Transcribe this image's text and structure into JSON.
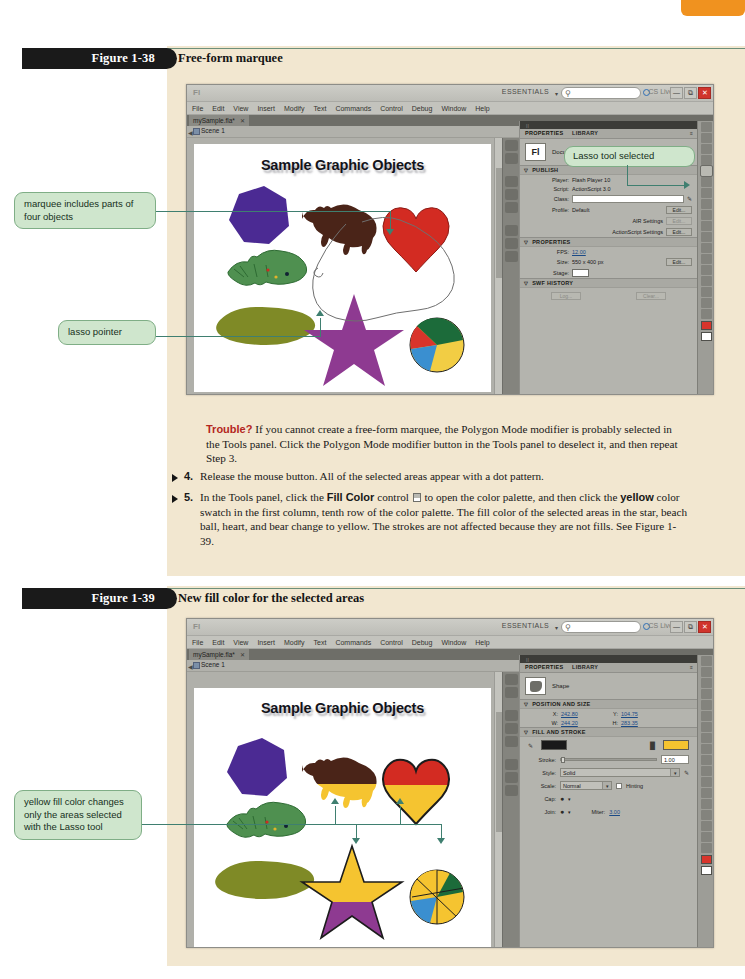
{
  "page": {
    "tab_color": "#f0921f",
    "content_bg": "#f2e7d0"
  },
  "figures": [
    {
      "number": "Figure 1-38",
      "caption": "Free-form marquee"
    },
    {
      "number": "Figure 1-39",
      "caption": "New fill color for the selected areas"
    }
  ],
  "flash_window": {
    "app_logo": "Fl",
    "workspace": "ESSENTIALS",
    "workspace_caret": "▾",
    "search_icon": "search-icon",
    "search_value": "",
    "cs_live": "CS Live",
    "cs_live_caret": "▾",
    "win_buttons": [
      "—",
      "⧉",
      "✕"
    ],
    "menus": [
      "File",
      "Edit",
      "View",
      "Insert",
      "Modify",
      "Text",
      "Commands",
      "Control",
      "Debug",
      "Window",
      "Help"
    ],
    "document_tab": "mySample.fla*",
    "document_tab_close": "✕",
    "scene": "Scene 1",
    "scene_back_arrow": "⬅",
    "zoom_level": "116%",
    "zoom_caret": "▾",
    "stage_title": "Sample Graphic Objects"
  },
  "properties_panel_doc": {
    "tabs": [
      "PROPERTIES",
      "LIBRARY"
    ],
    "menu_icon": "≡",
    "thumb_label": "Fl",
    "type": "Document",
    "sections": [
      {
        "title": "PUBLISH",
        "rows": [
          {
            "key": "Player:",
            "value": "Flash Player 10",
            "kind": "text"
          },
          {
            "key": "Script:",
            "value": "ActionScript 3.0",
            "kind": "text"
          },
          {
            "key": "Class:",
            "value": "",
            "kind": "field-pencil"
          },
          {
            "key": "Profile:",
            "value": "Default",
            "button": "Edit...",
            "kind": "text-button"
          },
          {
            "key": "",
            "value": "AIR Settings",
            "button": "Edit...",
            "kind": "right-button-dim"
          },
          {
            "key": "",
            "value": "ActionScript Settings",
            "button": "Edit...",
            "kind": "right-button"
          }
        ]
      },
      {
        "title": "PROPERTIES",
        "rows": [
          {
            "key": "FPS:",
            "value": "12.00",
            "kind": "link"
          },
          {
            "key": "Size:",
            "value": "550 x 400 px",
            "button": "Edit...",
            "kind": "text-button"
          },
          {
            "key": "Stage:",
            "value": "",
            "kind": "swatch"
          }
        ]
      },
      {
        "title": "SWF HISTORY",
        "rows": [
          {
            "key": "",
            "value": "",
            "button": "Log...",
            "button2": "Clear...",
            "kind": "two-buttons"
          }
        ]
      }
    ]
  },
  "properties_panel_shape": {
    "tabs": [
      "PROPERTIES",
      "LIBRARY"
    ],
    "menu_icon": "≡",
    "type": "Shape",
    "sections": [
      {
        "title": "POSITION AND SIZE",
        "rows": [
          {
            "key": "X:",
            "value": "242.80",
            "key2": "Y:",
            "value2": "104.75"
          },
          {
            "key": "W:",
            "value": "244.20",
            "key2": "H:",
            "value2": "283.35"
          }
        ]
      },
      {
        "title": "FILL AND STROKE",
        "rows": [
          {
            "stroke_color": "#1a1a1a",
            "fill_color": "#f5c430"
          },
          {
            "key": "Stroke:",
            "value": "1.00"
          },
          {
            "key": "Style:",
            "value": "Solid"
          },
          {
            "key": "Scale:",
            "value": "Normal",
            "checkbox_label": "Hinting"
          },
          {
            "key": "Cap:",
            "value": ""
          },
          {
            "key": "Join:",
            "value": "",
            "key2": "Miter:",
            "value2": "3.00"
          }
        ]
      }
    ]
  },
  "callouts": [
    {
      "id": "marquee-objects",
      "text": "marquee includes parts of four objects"
    },
    {
      "id": "lasso-pointer",
      "text": "lasso pointer"
    },
    {
      "id": "lasso-tool-selected",
      "text": "Lasso tool selected"
    },
    {
      "id": "yellow-fill",
      "text": "yellow fill color changes only the areas selected with the Lasso tool"
    }
  ],
  "body": {
    "trouble_label": "Trouble?",
    "trouble_text": "If you cannot create a free-form marquee, the Polygon Mode modifier is probably selected in the Tools panel. Click the Polygon Mode modifier button in the Tools panel to deselect it, and then repeat Step 3.",
    "steps": [
      {
        "num": "4.",
        "parts": [
          {
            "t": "Release the mouse button. All of the selected areas appear with a dot pattern.",
            "b": false
          }
        ]
      },
      {
        "num": "5.",
        "parts": [
          {
            "t": "In the Tools panel, click the ",
            "b": false
          },
          {
            "t": "Fill Color",
            "b": true
          },
          {
            "t": " control ",
            "b": false
          },
          {
            "t": "[fill-color-icon]",
            "b": false
          },
          {
            "t": " to open the color palette, and then click the ",
            "b": false
          },
          {
            "t": "yellow",
            "b": true
          },
          {
            "t": " color swatch in the first column, tenth row of the color palette. The fill color of the selected areas in the star, beach ball, heart, and bear change to yellow. The strokes are not affected because they are not fills. See Figure 1-39.",
            "b": false
          }
        ]
      }
    ]
  },
  "stage_objects_fig1": [
    {
      "name": "heptagon",
      "color": "#4b2a93"
    },
    {
      "name": "bear",
      "color": "#4a2418"
    },
    {
      "name": "heart",
      "color": "#d32b22"
    },
    {
      "name": "fish",
      "color": "#4f9050"
    },
    {
      "name": "blob",
      "color": "#7f8a26"
    },
    {
      "name": "star",
      "color": "#8e3a91"
    },
    {
      "name": "beach-ball",
      "colors": [
        "#1c6b3a",
        "#f2cd44",
        "#d9342b",
        "#3a8fd0"
      ]
    }
  ],
  "stage_objects_fig2": [
    {
      "name": "heptagon",
      "color": "#4b2a93"
    },
    {
      "name": "bear",
      "color": "#4a2418",
      "fill": "#f5c430"
    },
    {
      "name": "heart",
      "color": "#d32b22",
      "fill": "#f5c430"
    },
    {
      "name": "fish",
      "color": "#4f9050"
    },
    {
      "name": "blob",
      "color": "#7f8a26"
    },
    {
      "name": "star",
      "color": "#8e3a91",
      "fill": "#f5c430"
    },
    {
      "name": "beach-ball",
      "fill": "#f5c430"
    }
  ],
  "tools_panel": {
    "icons": [
      "selection-tool-icon",
      "subselection-tool-icon",
      "free-transform-tool-icon",
      "lasso-tool-icon",
      "pen-tool-icon",
      "text-tool-icon",
      "line-tool-icon",
      "rectangle-tool-icon",
      "pencil-tool-icon",
      "brush-tool-icon",
      "deco-tool-icon",
      "bone-tool-icon",
      "paint-bucket-tool-icon",
      "eyedropper-tool-icon",
      "eraser-tool-icon",
      "hand-tool-icon",
      "zoom-tool-icon"
    ],
    "stroke_swatch": "#d8352c",
    "fill_swatch": "#ffffff"
  }
}
